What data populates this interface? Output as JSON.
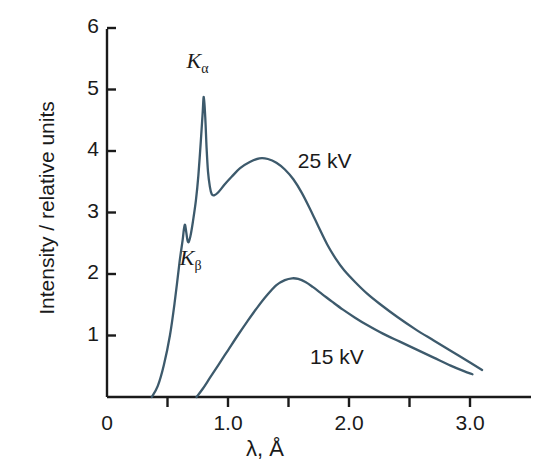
{
  "chart_data": {
    "type": "line",
    "title": "",
    "xlabel": "λ, Å",
    "ylabel": "Intensity / relative units",
    "xlim": [
      0,
      3.45
    ],
    "ylim": [
      0,
      6.2
    ],
    "grid": false,
    "legend_position": "inline-annotation",
    "xticks": [
      {
        "value": 0,
        "label": "0"
      },
      {
        "value": 0.5,
        "label": ""
      },
      {
        "value": 1.0,
        "label": "1.0"
      },
      {
        "value": 1.5,
        "label": ""
      },
      {
        "value": 2.0,
        "label": "2.0"
      },
      {
        "value": 2.5,
        "label": ""
      },
      {
        "value": 3.0,
        "label": "3.0"
      }
    ],
    "yticks": [
      {
        "value": 1,
        "label": "1"
      },
      {
        "value": 2,
        "label": "2"
      },
      {
        "value": 3,
        "label": "3"
      },
      {
        "value": 4,
        "label": "4"
      },
      {
        "value": 5,
        "label": "5"
      },
      {
        "value": 6,
        "label": "6"
      }
    ],
    "line_color": "#3d5a6c",
    "axis_color": "#1a1a1a",
    "annotations": [
      {
        "text": "Kα",
        "symbol": "K",
        "subscript": "α",
        "x": 0.79,
        "y": 5.45
      },
      {
        "text": "Kβ",
        "symbol": "K",
        "subscript": "β",
        "x": 0.7,
        "y": 2.25
      },
      {
        "text": "25 kV",
        "x": 1.66,
        "y": 3.8
      },
      {
        "text": "15 kV",
        "x": 1.76,
        "y": 0.62
      }
    ],
    "series": [
      {
        "name": "25 kV",
        "label": "25 kV",
        "points": [
          [
            0.37,
            0.0
          ],
          [
            0.42,
            0.18
          ],
          [
            0.47,
            0.52
          ],
          [
            0.52,
            1.0
          ],
          [
            0.56,
            1.55
          ],
          [
            0.6,
            2.2
          ],
          [
            0.625,
            2.55
          ],
          [
            0.635,
            2.72
          ],
          [
            0.645,
            2.8
          ],
          [
            0.655,
            2.68
          ],
          [
            0.665,
            2.55
          ],
          [
            0.675,
            2.52
          ],
          [
            0.69,
            2.62
          ],
          [
            0.71,
            2.85
          ],
          [
            0.735,
            3.2
          ],
          [
            0.755,
            3.6
          ],
          [
            0.775,
            4.15
          ],
          [
            0.79,
            4.6
          ],
          [
            0.8,
            4.88
          ],
          [
            0.812,
            4.55
          ],
          [
            0.823,
            4.05
          ],
          [
            0.835,
            3.66
          ],
          [
            0.85,
            3.42
          ],
          [
            0.865,
            3.3
          ],
          [
            0.885,
            3.28
          ],
          [
            0.92,
            3.33
          ],
          [
            0.97,
            3.45
          ],
          [
            1.03,
            3.58
          ],
          [
            1.1,
            3.72
          ],
          [
            1.18,
            3.82
          ],
          [
            1.26,
            3.88
          ],
          [
            1.33,
            3.87
          ],
          [
            1.4,
            3.81
          ],
          [
            1.47,
            3.7
          ],
          [
            1.54,
            3.54
          ],
          [
            1.61,
            3.32
          ],
          [
            1.68,
            3.05
          ],
          [
            1.75,
            2.76
          ],
          [
            1.82,
            2.48
          ],
          [
            1.89,
            2.25
          ],
          [
            1.96,
            2.06
          ],
          [
            2.05,
            1.87
          ],
          [
            2.15,
            1.68
          ],
          [
            2.25,
            1.52
          ],
          [
            2.4,
            1.3
          ],
          [
            2.55,
            1.1
          ],
          [
            2.7,
            0.92
          ],
          [
            2.85,
            0.74
          ],
          [
            3.0,
            0.56
          ],
          [
            3.1,
            0.44
          ]
        ]
      },
      {
        "name": "15 kV",
        "label": "15 kV",
        "points": [
          [
            0.74,
            0.0
          ],
          [
            0.79,
            0.13
          ],
          [
            0.85,
            0.31
          ],
          [
            0.92,
            0.52
          ],
          [
            1.0,
            0.76
          ],
          [
            1.08,
            1.0
          ],
          [
            1.16,
            1.23
          ],
          [
            1.24,
            1.45
          ],
          [
            1.32,
            1.65
          ],
          [
            1.4,
            1.82
          ],
          [
            1.47,
            1.9
          ],
          [
            1.53,
            1.93
          ],
          [
            1.58,
            1.92
          ],
          [
            1.64,
            1.87
          ],
          [
            1.7,
            1.79
          ],
          [
            1.78,
            1.67
          ],
          [
            1.86,
            1.55
          ],
          [
            1.95,
            1.42
          ],
          [
            2.05,
            1.29
          ],
          [
            2.15,
            1.17
          ],
          [
            2.28,
            1.03
          ],
          [
            2.42,
            0.9
          ],
          [
            2.56,
            0.77
          ],
          [
            2.7,
            0.64
          ],
          [
            2.84,
            0.51
          ],
          [
            2.95,
            0.42
          ],
          [
            3.02,
            0.37
          ]
        ]
      }
    ]
  },
  "axes": {
    "y_title": "Intensity / relative units",
    "x_title": "λ, Å",
    "x_tick_labels": [
      "0",
      "1.0",
      "2.0",
      "3.0"
    ],
    "y_tick_labels": [
      "1",
      "2",
      "3",
      "4",
      "5",
      "6"
    ]
  },
  "labels": {
    "k_alpha_symbol": "K",
    "k_alpha_sub": "α",
    "k_beta_symbol": "K",
    "k_beta_sub": "β",
    "series_25kv": "25 kV",
    "series_15kv": "15 kV"
  }
}
